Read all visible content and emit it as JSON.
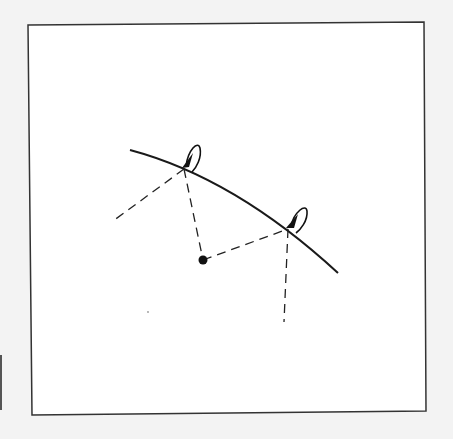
{
  "figure": {
    "background": "#f3f3f3",
    "panel_fill": "#ffffff",
    "stroke_color": "#1a1a1a",
    "panel": {
      "corners": [
        [
          28,
          25
        ],
        [
          424,
          22
        ],
        [
          426,
          411
        ],
        [
          32,
          415
        ]
      ]
    },
    "trajectory_curve": {
      "path": "M130,150 Q235,178 338,273",
      "width": 2
    },
    "center_point": {
      "cx": 203,
      "cy": 260,
      "r": 4.5
    },
    "contact_points": [
      {
        "id": "A",
        "x": 184,
        "y": 169
      },
      {
        "id": "B",
        "x": 288,
        "y": 229
      }
    ],
    "dashed_lines": [
      {
        "id": "tangent-A",
        "x1": 184,
        "y1": 169,
        "x2": 113,
        "y2": 221
      },
      {
        "id": "radius-A",
        "x1": 184,
        "y1": 169,
        "x2": 203,
        "y2": 260
      },
      {
        "id": "radius-B",
        "x1": 203,
        "y1": 260,
        "x2": 288,
        "y2": 229
      },
      {
        "id": "tangent-B",
        "x1": 288,
        "y1": 229,
        "x2": 284,
        "y2": 322
      }
    ],
    "rotation_arrows": [
      {
        "id": "spin-A",
        "loop": "M186,166 C188,150 198,140 200,148 C202,158 196,168 192,172",
        "head": "182,168 193,153 189,167"
      },
      {
        "id": "spin-B",
        "loop": "M291,226 C294,212 306,203 307,211 C308,221 300,230 296,233",
        "head": "286,228 298,214 294,228"
      }
    ],
    "stray_mark": {
      "x": 148,
      "y": 312
    }
  }
}
